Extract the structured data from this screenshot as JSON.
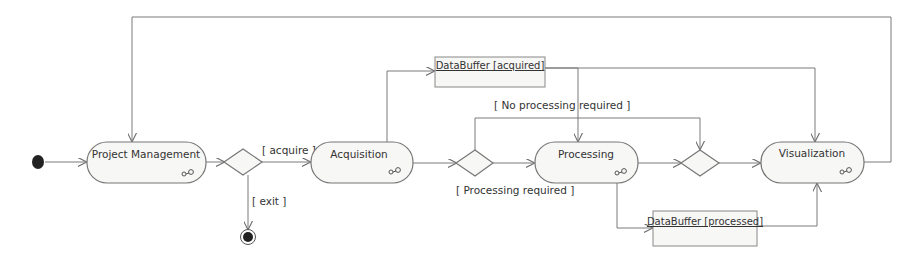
{
  "diagram": {
    "type": "UML activity diagram",
    "colors": {
      "background": "#ffffff",
      "stroke": "#777777",
      "node_fill": "#f7f7f5",
      "text": "#333333",
      "initial_final_fill": "#222222"
    },
    "nodes": {
      "initial": {
        "kind": "initial-node"
      },
      "project_management": {
        "label": "Project Management",
        "kind": "action",
        "icon": "subactivity-icon"
      },
      "decision_acquire": {
        "kind": "decision"
      },
      "acquisition": {
        "label": "Acquisition",
        "kind": "action",
        "icon": "subactivity-icon"
      },
      "final": {
        "kind": "final-node"
      },
      "buffer_acquired": {
        "label": "DataBuffer [acquired]",
        "kind": "object"
      },
      "decision_processing": {
        "kind": "decision"
      },
      "processing": {
        "label": "Processing",
        "kind": "action",
        "icon": "subactivity-icon"
      },
      "decision_merge": {
        "kind": "merge"
      },
      "visualization": {
        "label": "Visualization",
        "kind": "action",
        "icon": "subactivity-icon"
      },
      "buffer_processed": {
        "label": "DataBuffer [processed]",
        "kind": "object"
      }
    },
    "guards": {
      "acquire": "[ acquire ]",
      "exit": "[ exit ]",
      "no_processing": "[ No processing required ]",
      "processing_required": "[ Processing required ]"
    },
    "edges": [
      {
        "from": "initial",
        "to": "project_management"
      },
      {
        "from": "project_management",
        "to": "decision_acquire"
      },
      {
        "from": "decision_acquire",
        "to": "acquisition",
        "guard": "[ acquire ]"
      },
      {
        "from": "decision_acquire",
        "to": "final",
        "guard": "[ exit ]"
      },
      {
        "from": "acquisition",
        "to": "buffer_acquired"
      },
      {
        "from": "acquisition",
        "to": "decision_processing"
      },
      {
        "from": "decision_processing",
        "to": "processing",
        "guard": "[ Processing required ]"
      },
      {
        "from": "decision_processing",
        "to": "decision_merge",
        "guard": "[ No processing required ]"
      },
      {
        "from": "buffer_acquired",
        "to": "processing"
      },
      {
        "from": "buffer_acquired",
        "to": "visualization"
      },
      {
        "from": "processing",
        "to": "decision_merge"
      },
      {
        "from": "processing",
        "to": "buffer_processed"
      },
      {
        "from": "buffer_processed",
        "to": "visualization"
      },
      {
        "from": "decision_merge",
        "to": "visualization"
      },
      {
        "from": "visualization",
        "to": "project_management"
      }
    ]
  }
}
